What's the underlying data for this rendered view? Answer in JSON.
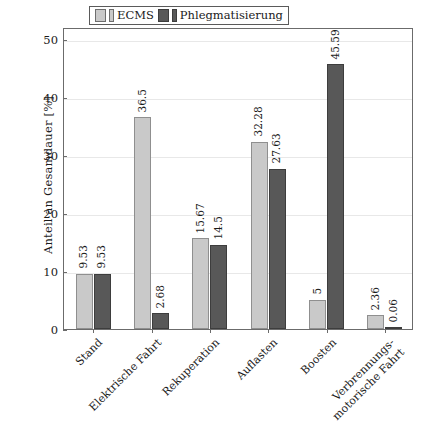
{
  "chart_data": {
    "type": "bar",
    "title": "",
    "xlabel": "",
    "ylabel": "Anteil an Gesamdauer [%]",
    "ylim": [
      0,
      52
    ],
    "yticks": [
      0,
      10,
      20,
      30,
      40,
      50
    ],
    "ytick_labels": [
      "0",
      "10",
      "20",
      "30",
      "40",
      "50"
    ],
    "grid": true,
    "legend_position": "upper center",
    "categories": [
      "Stand",
      "Elektrische Fahrt",
      "Rekuperation",
      "Auflasten",
      "Boosten",
      "Verbrennungs-motorische Fahrt"
    ],
    "category_lines": [
      [
        "Stand",
        ""
      ],
      [
        "Elektrische Fahrt",
        ""
      ],
      [
        "Rekuperation",
        ""
      ],
      [
        "Auflasten",
        ""
      ],
      [
        "Boosten",
        ""
      ],
      [
        "Verbrennungs-",
        "motorische Fahrt"
      ]
    ],
    "series": [
      {
        "name": "ECMS",
        "color": "#c9c9c9",
        "values": [
          9.53,
          36.5,
          15.67,
          32.28,
          5,
          2.36
        ],
        "labels": [
          "9.53",
          "36.5",
          "15.67",
          "32.28",
          "5",
          "2.36"
        ]
      },
      {
        "name": "Phlegmatisierung",
        "color": "#585858",
        "values": [
          9.53,
          2.68,
          14.5,
          27.63,
          45.59,
          0.06
        ],
        "labels": [
          "9.53",
          "2.68",
          "14.5",
          "27.63",
          "45.59",
          "0.06"
        ]
      }
    ]
  },
  "legend": {
    "entries": [
      {
        "label": "ECMS"
      },
      {
        "label": "Phlegmatisierung"
      }
    ]
  },
  "axes": {
    "y_title": "Anteil an Gesamdauer [%]"
  }
}
